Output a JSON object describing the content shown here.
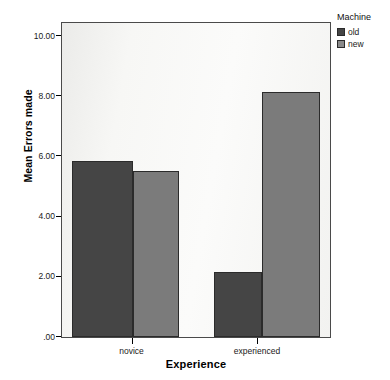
{
  "chart_data": {
    "type": "bar",
    "title": "",
    "xlabel": "Experience",
    "ylabel": "Mean Errors made",
    "categories": [
      "novice",
      "experienced"
    ],
    "series": [
      {
        "name": "old",
        "values": [
          5.85,
          2.15
        ],
        "color": "#454545"
      },
      {
        "name": "new",
        "values": [
          5.5,
          8.15
        ],
        "color": "#7b7b7b"
      }
    ],
    "ylim": [
      0,
      10.4
    ],
    "yticks": [
      0,
      2,
      4,
      6,
      8,
      10
    ],
    "ytick_labels": [
      ".00",
      "2.00",
      "4.00",
      "6.00",
      "8.00",
      "10.00"
    ],
    "grid": false,
    "legend": {
      "title": "Machine",
      "position": "right-top",
      "entries": [
        "old",
        "new"
      ]
    },
    "plot_background": "#f7f7f5",
    "frame_color": "#4a4a4a"
  },
  "axes": {
    "y_title": "Mean Errors made",
    "x_title": "Experience",
    "y_ticks": [
      {
        "label": "10.00",
        "value": 10
      },
      {
        "label": "8.00",
        "value": 8
      },
      {
        "label": "6.00",
        "value": 6
      },
      {
        "label": "4.00",
        "value": 4
      },
      {
        "label": "2.00",
        "value": 2
      },
      {
        "label": ".00",
        "value": 0
      }
    ],
    "x_ticks": [
      {
        "label": "novice"
      },
      {
        "label": "experienced"
      }
    ]
  },
  "legend": {
    "title": "Machine",
    "items": [
      {
        "label": "old",
        "color": "#454545"
      },
      {
        "label": "new",
        "color": "#8a8a8a"
      }
    ]
  }
}
